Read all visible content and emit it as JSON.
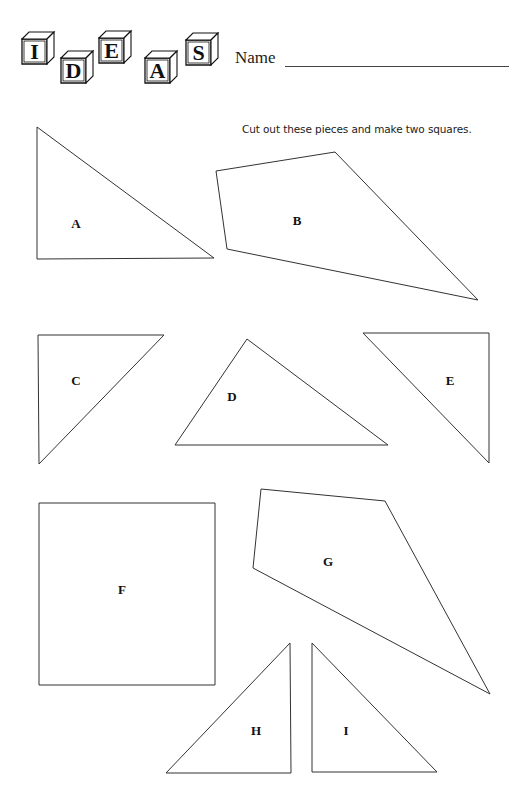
{
  "header": {
    "logo_letters": [
      "I",
      "D",
      "E",
      "A",
      "S"
    ],
    "name_label": "Name"
  },
  "instructions": "Cut out these pieces and make two squares.",
  "pieces": [
    {
      "label": "A",
      "type": "triangle",
      "points": [
        [
          37,
          127
        ],
        [
          37,
          259
        ],
        [
          214,
          258
        ]
      ],
      "label_pos": [
        76,
        224
      ]
    },
    {
      "label": "B",
      "type": "quadrilateral",
      "points": [
        [
          216,
          171
        ],
        [
          335,
          152
        ],
        [
          478,
          300
        ],
        [
          227,
          249
        ]
      ],
      "label_pos": [
        297,
        221
      ]
    },
    {
      "label": "C",
      "type": "triangle",
      "points": [
        [
          38,
          335
        ],
        [
          164,
          335
        ],
        [
          39,
          464
        ]
      ],
      "label_pos": [
        76,
        381
      ]
    },
    {
      "label": "D",
      "type": "triangle",
      "points": [
        [
          247,
          339
        ],
        [
          388,
          445
        ],
        [
          175,
          445
        ]
      ],
      "label_pos": [
        232,
        397
      ]
    },
    {
      "label": "E",
      "type": "triangle",
      "points": [
        [
          363,
          333
        ],
        [
          489,
          333
        ],
        [
          489,
          463
        ]
      ],
      "label_pos": [
        450,
        381
      ]
    },
    {
      "label": "F",
      "type": "square",
      "points": [
        [
          39,
          503
        ],
        [
          215,
          503
        ],
        [
          215,
          685
        ],
        [
          39,
          685
        ]
      ],
      "label_pos": [
        122,
        590
      ]
    },
    {
      "label": "G",
      "type": "quadrilateral",
      "points": [
        [
          261,
          489
        ],
        [
          385,
          501
        ],
        [
          490,
          694
        ],
        [
          253,
          568
        ]
      ],
      "label_pos": [
        328,
        562
      ]
    },
    {
      "label": "H",
      "type": "triangle",
      "points": [
        [
          290,
          643
        ],
        [
          291,
          773
        ],
        [
          166,
          773
        ]
      ],
      "label_pos": [
        256,
        731
      ]
    },
    {
      "label": "I",
      "type": "triangle",
      "points": [
        [
          312,
          643
        ],
        [
          312,
          772
        ],
        [
          437,
          772
        ]
      ],
      "label_pos": [
        346,
        731
      ]
    }
  ]
}
